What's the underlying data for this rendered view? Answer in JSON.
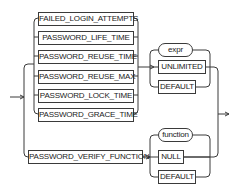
{
  "diagram": {
    "type": "railroad-syntax-diagram",
    "group1": {
      "keywords": [
        "FAILED_LOGIN_ATTEMPTS",
        "PASSWORD_LIFE_TIME",
        "PASSWORD_REUSE_TIME",
        "PASSWORD_REUSE_MAX",
        "PASSWORD_LOCK_TIME",
        "PASSWORD_GRACE_TIME"
      ],
      "values": [
        {
          "label": "expr",
          "kind": "variable"
        },
        {
          "label": "UNLIMITED",
          "kind": "keyword"
        },
        {
          "label": "DEFAULT",
          "kind": "keyword"
        }
      ]
    },
    "group2": {
      "keyword": "PASSWORD_VERIFY_FUNCTION",
      "values": [
        {
          "label": "function",
          "kind": "variable"
        },
        {
          "label": "NULL",
          "kind": "keyword"
        },
        {
          "label": "DEFAULT",
          "kind": "keyword"
        }
      ]
    },
    "colors": {
      "line": "#3a3a3a",
      "background": "#ffffff"
    }
  }
}
